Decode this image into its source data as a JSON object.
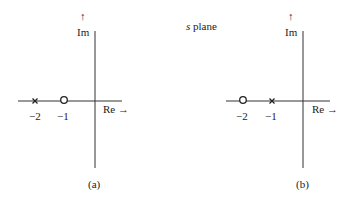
{
  "title": {
    "variable": "s",
    "text": "plane"
  },
  "panels": [
    {
      "caption": "(a)",
      "axis_re_label": "Re →",
      "axis_im_label": "Im",
      "axis_im_arrow": "↑",
      "poles": [
        {
          "value": -2,
          "label": "−2"
        }
      ],
      "zeros": [
        {
          "value": -1,
          "label": "−1"
        }
      ]
    },
    {
      "caption": "(b)",
      "axis_re_label": "Re →",
      "axis_im_label": "Im",
      "axis_im_arrow": "↑",
      "poles": [
        {
          "value": -1,
          "label": "−1"
        }
      ],
      "zeros": [
        {
          "value": -2,
          "label": "−2"
        }
      ]
    }
  ],
  "colors": {
    "line": "#333333",
    "text": "#222222",
    "background": "#ffffff"
  }
}
